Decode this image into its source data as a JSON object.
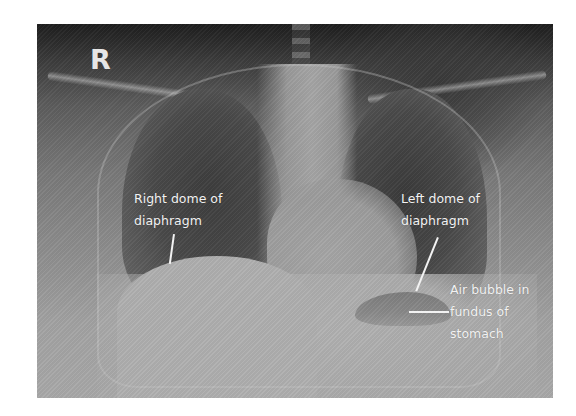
{
  "figure": {
    "type": "chest x-ray (PA view)",
    "side_marker": "R",
    "labels": [
      {
        "id": "right-dome",
        "lines": [
          "Right dome of",
          "diaphragm"
        ]
      },
      {
        "id": "left-dome",
        "lines": [
          "Left dome of",
          "diaphragm"
        ]
      },
      {
        "id": "air-bubble",
        "lines": [
          "Air bubble in",
          "fundus of",
          "stomach"
        ]
      }
    ],
    "colors": {
      "background": "#ffffff",
      "label_text": "#f2f2f2",
      "film_dark": "#1e1e1e",
      "film_light": "#b0b0b0"
    }
  }
}
